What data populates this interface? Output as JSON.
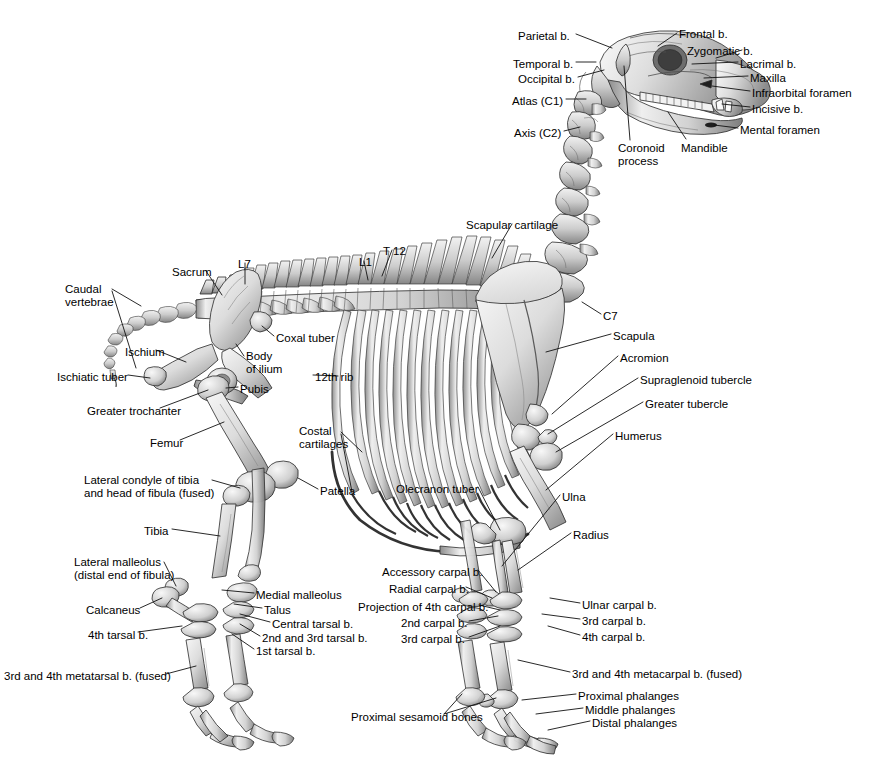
{
  "figure": {
    "background_color": "#ffffff",
    "ink_color": "#000000",
    "bone_fill": "#e9e9e9",
    "bone_shade": "#9a9a9a",
    "bone_dark": "#5a5a5a",
    "leader_line_color": "#1a1a1a"
  },
  "labels": {
    "skull": [
      {
        "id": "parietal",
        "text": "Parietal b.",
        "x": 518,
        "y": 30,
        "align": "left"
      },
      {
        "id": "frontal",
        "text": "Frontal b.",
        "x": 679,
        "y": 28,
        "align": "left"
      },
      {
        "id": "zygomatic",
        "text": "Zygomatic b.",
        "x": 687,
        "y": 45,
        "align": "left"
      },
      {
        "id": "temporal",
        "text": "Temporal b.",
        "x": 513,
        "y": 58,
        "align": "left"
      },
      {
        "id": "lacrimal",
        "text": "Lacrimal b.",
        "x": 740,
        "y": 58,
        "align": "left"
      },
      {
        "id": "occipital",
        "text": "Occipital b.",
        "x": 518,
        "y": 73,
        "align": "left"
      },
      {
        "id": "maxilla",
        "text": "Maxilla",
        "x": 750,
        "y": 72,
        "align": "left"
      },
      {
        "id": "infraorbital-foramen",
        "text": "Infraorbital foramen",
        "x": 752,
        "y": 87,
        "align": "left"
      },
      {
        "id": "atlas-c1",
        "text": "Atlas (C1)",
        "x": 512,
        "y": 95,
        "align": "left"
      },
      {
        "id": "incisive",
        "text": "Incisive b.",
        "x": 752,
        "y": 103,
        "align": "left"
      },
      {
        "id": "axis-c2",
        "text": "Axis (C2)",
        "x": 514,
        "y": 127,
        "align": "left"
      },
      {
        "id": "mental-foramen",
        "text": "Mental foramen",
        "x": 740,
        "y": 124,
        "align": "left"
      },
      {
        "id": "mandible",
        "text": "Mandible",
        "x": 681,
        "y": 142,
        "align": "left"
      },
      {
        "id": "coronoid-process",
        "text": "Coronoid\nprocess",
        "x": 618,
        "y": 142,
        "align": "left"
      }
    ],
    "spine": [
      {
        "id": "scapular-cartilage",
        "text": "Scapular cartilage",
        "x": 466,
        "y": 219,
        "align": "left"
      },
      {
        "id": "t12",
        "text": "T 12",
        "x": 383,
        "y": 245,
        "align": "left"
      },
      {
        "id": "l7",
        "text": "L7",
        "x": 238,
        "y": 258,
        "align": "left"
      },
      {
        "id": "l1",
        "text": "L1",
        "x": 359,
        "y": 256,
        "align": "left"
      },
      {
        "id": "sacrum",
        "text": "Sacrum",
        "x": 172,
        "y": 266,
        "align": "left"
      },
      {
        "id": "caudal-vertebrae",
        "text": "Caudal\nvertebrae",
        "x": 65,
        "y": 283,
        "align": "left"
      },
      {
        "id": "c7",
        "text": "C7",
        "x": 603,
        "y": 310,
        "align": "left"
      },
      {
        "id": "coxal-tuber",
        "text": "Coxal tuber",
        "x": 276,
        "y": 332,
        "align": "left"
      },
      {
        "id": "scapula",
        "text": "Scapula",
        "x": 613,
        "y": 330,
        "align": "left"
      },
      {
        "id": "ischium",
        "text": "Ischium",
        "x": 125,
        "y": 346,
        "align": "left"
      },
      {
        "id": "body-of-ilium",
        "text": "Body\nof ilium",
        "x": 246,
        "y": 350,
        "align": "left"
      },
      {
        "id": "acromion",
        "text": "Acromion",
        "x": 620,
        "y": 352,
        "align": "left"
      },
      {
        "id": "twelfth-rib",
        "text": "12th rib",
        "x": 315,
        "y": 371,
        "align": "left"
      },
      {
        "id": "ischiatic-tuber",
        "text": "Ischiatic tuber",
        "x": 57,
        "y": 371,
        "align": "left"
      },
      {
        "id": "supraglenoid-tubercle",
        "text": "Supraglenoid tubercle",
        "x": 640,
        "y": 374,
        "align": "left"
      },
      {
        "id": "pubis",
        "text": "Pubis",
        "x": 240,
        "y": 383,
        "align": "left"
      },
      {
        "id": "greater-tubercle",
        "text": "Greater tubercle",
        "x": 645,
        "y": 398,
        "align": "left"
      },
      {
        "id": "greater-trochanter",
        "text": "Greater trochanter",
        "x": 87,
        "y": 405,
        "align": "left"
      },
      {
        "id": "costal-cartilages",
        "text": "Costal\ncartilages",
        "x": 299,
        "y": 425,
        "align": "left"
      },
      {
        "id": "humerus",
        "text": "Humerus",
        "x": 615,
        "y": 430,
        "align": "left"
      },
      {
        "id": "femur",
        "text": "Femur",
        "x": 150,
        "y": 437,
        "align": "left"
      }
    ],
    "hindlimb": [
      {
        "id": "lateral-condyle-tibia",
        "text": "Lateral condyle of tibia\nand head of fibula (fused)",
        "x": 84,
        "y": 474,
        "align": "left"
      },
      {
        "id": "patella",
        "text": "Patella",
        "x": 320,
        "y": 485,
        "align": "left"
      },
      {
        "id": "olecranon-tuber",
        "text": "Olecranon tuber",
        "x": 396,
        "y": 483,
        "align": "left"
      },
      {
        "id": "ulna",
        "text": "Ulna",
        "x": 562,
        "y": 491,
        "align": "left"
      },
      {
        "id": "tibia",
        "text": "Tibia",
        "x": 144,
        "y": 525,
        "align": "left"
      },
      {
        "id": "radius",
        "text": "Radius",
        "x": 573,
        "y": 529,
        "align": "left"
      },
      {
        "id": "lateral-malleolus",
        "text": "Lateral malleolus\n(distal end of fibula)",
        "x": 74,
        "y": 556,
        "align": "left"
      },
      {
        "id": "medial-malleolus",
        "text": "Medial malleolus",
        "x": 256,
        "y": 589,
        "align": "left"
      },
      {
        "id": "talus",
        "text": "Talus",
        "x": 264,
        "y": 604,
        "align": "left"
      },
      {
        "id": "calcaneus",
        "text": "Calcaneus",
        "x": 86,
        "y": 604,
        "align": "left"
      },
      {
        "id": "central-tarsal",
        "text": "Central tarsal b.",
        "x": 272,
        "y": 618,
        "align": "left"
      },
      {
        "id": "fourth-tarsal",
        "text": "4th tarsal b.",
        "x": 88,
        "y": 629,
        "align": "left"
      },
      {
        "id": "second-third-tarsal",
        "text": "2nd and 3rd tarsal b.",
        "x": 262,
        "y": 632,
        "align": "left"
      },
      {
        "id": "first-tarsal",
        "text": "1st tarsal b.",
        "x": 256,
        "y": 645,
        "align": "left"
      },
      {
        "id": "third-fourth-metatarsal",
        "text": "3rd and 4th metatarsal b. (fused)",
        "x": 4,
        "y": 670,
        "align": "left"
      }
    ],
    "forelimb": [
      {
        "id": "accessory-carpal",
        "text": "Accessory carpal b.",
        "x": 382,
        "y": 566,
        "align": "left"
      },
      {
        "id": "radial-carpal",
        "text": "Radial carpal b.",
        "x": 389,
        "y": 583,
        "align": "left"
      },
      {
        "id": "ulnar-carpal",
        "text": "Ulnar carpal b.",
        "x": 582,
        "y": 599,
        "align": "left"
      },
      {
        "id": "projection-fourth-carpal",
        "text": "Projection of 4th carpal b.",
        "x": 358,
        "y": 601,
        "align": "left"
      },
      {
        "id": "second-carpal",
        "text": "2nd carpal b.",
        "x": 401,
        "y": 617,
        "align": "left"
      },
      {
        "id": "third-carpal-right",
        "text": "3rd carpal b.",
        "x": 582,
        "y": 615,
        "align": "left"
      },
      {
        "id": "third-carpal-left",
        "text": "3rd carpal b.",
        "x": 401,
        "y": 633,
        "align": "left"
      },
      {
        "id": "fourth-carpal",
        "text": "4th carpal b.",
        "x": 582,
        "y": 631,
        "align": "left"
      },
      {
        "id": "third-fourth-metacarpal",
        "text": "3rd and 4th metacarpal b. (fused)",
        "x": 572,
        "y": 668,
        "align": "left"
      },
      {
        "id": "proximal-phalanges",
        "text": "Proximal phalanges",
        "x": 578,
        "y": 690,
        "align": "left"
      },
      {
        "id": "middle-phalanges",
        "text": "Middle phalanges",
        "x": 585,
        "y": 704,
        "align": "left"
      },
      {
        "id": "distal-phalanges",
        "text": "Distal phalanges",
        "x": 592,
        "y": 717,
        "align": "left"
      },
      {
        "id": "proximal-sesamoid",
        "text": "Proximal sesamoid bones",
        "x": 351,
        "y": 711,
        "align": "left"
      }
    ]
  }
}
